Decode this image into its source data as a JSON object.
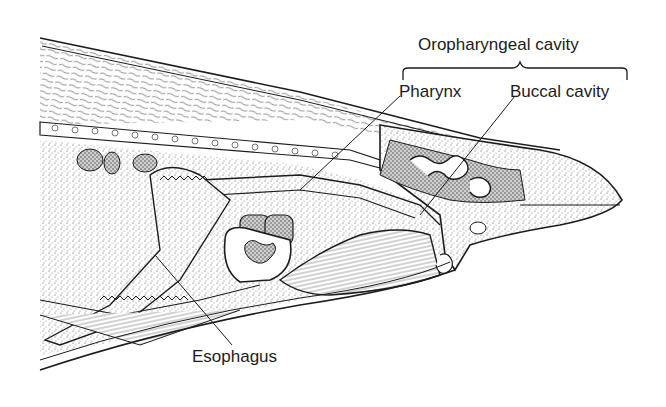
{
  "figure": {
    "type": "anatomical sagittal section illustration",
    "labels": {
      "oropharyngeal_cavity": "Oropharyngeal cavity",
      "pharynx": "Pharynx",
      "buccal_cavity": "Buccal cavity",
      "esophagus": "Esophagus"
    },
    "colors": {
      "ink": "#1c1c1c",
      "background": "#ffffff",
      "stipple": "#6a6a6a"
    }
  }
}
